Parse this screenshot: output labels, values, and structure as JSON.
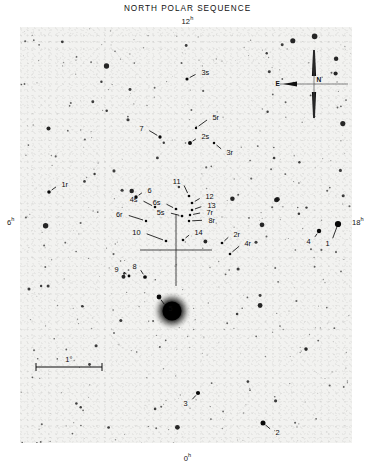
{
  "figure": {
    "title": "NORTH POLAR SEQUENCE",
    "top_axis": "12",
    "top_axis_sup": "h",
    "left_axis": "6",
    "left_axis_sup": "h",
    "right_axis": "18",
    "right_axis_sup": "h",
    "bottom_axis": "0",
    "bottom_axis_sup": "h"
  },
  "compass": {
    "north_label": "N",
    "east_label": "E"
  },
  "scale_bar": {
    "label": "1°"
  },
  "chart_data": {
    "type": "scatter",
    "title": "NORTH POLAR SEQUENCE",
    "xlabel": "Right Ascension (hours)",
    "ylabel": "",
    "grid": false,
    "legend": "none",
    "axis_markers": [
      {
        "position": "top",
        "label": "12h"
      },
      {
        "position": "left",
        "label": "6h"
      },
      {
        "position": "right",
        "label": "18h"
      },
      {
        "position": "bottom",
        "label": "0h"
      }
    ],
    "pole_marker": {
      "x": 176,
      "y": 250,
      "type": "crosshair"
    },
    "scale_bar_degrees": 1,
    "labeled_stars": [
      {
        "label": "3s",
        "lx": 200,
        "ly": 72,
        "sx": 187,
        "sy": 79,
        "mag": 3.0
      },
      {
        "label": "5r",
        "lx": 211,
        "ly": 117,
        "sx": 196,
        "sy": 128,
        "mag": 2.3
      },
      {
        "label": "7",
        "lx": 145,
        "ly": 128,
        "sx": 160,
        "sy": 137,
        "mag": 3.2
      },
      {
        "label": "2s",
        "lx": 200,
        "ly": 136,
        "sx": 190,
        "sy": 143,
        "mag": 3.8
      },
      {
        "label": "3r",
        "lx": 225,
        "ly": 152,
        "sx": 214,
        "sy": 143,
        "mag": 2.4
      },
      {
        "label": "1r",
        "lx": 60,
        "ly": 184,
        "sx": 49,
        "sy": 192,
        "mag": 3.4
      },
      {
        "label": "6",
        "lx": 146,
        "ly": 190,
        "sx": 136,
        "sy": 197,
        "mag": 3.3
      },
      {
        "label": "11",
        "lx": 182,
        "ly": 181,
        "sx": 189,
        "sy": 196,
        "mag": 2.6
      },
      {
        "label": "12",
        "lx": 204,
        "ly": 196,
        "sx": 192,
        "sy": 203,
        "mag": 2.6
      },
      {
        "label": "4s",
        "lx": 139,
        "ly": 199,
        "sx": 155,
        "sy": 207,
        "mag": 2.5
      },
      {
        "label": "6s",
        "lx": 162,
        "ly": 202,
        "sx": 176,
        "sy": 209,
        "mag": 2.6
      },
      {
        "label": "13",
        "lx": 206,
        "ly": 205,
        "sx": 192,
        "sy": 210,
        "mag": 2.5
      },
      {
        "label": "7r",
        "lx": 205,
        "ly": 212,
        "sx": 190,
        "sy": 215,
        "mag": 2.4
      },
      {
        "label": "5s",
        "lx": 166,
        "ly": 212,
        "sx": 182,
        "sy": 216,
        "mag": 2.6
      },
      {
        "label": "6r",
        "lx": 124,
        "ly": 214,
        "sx": 146,
        "sy": 221,
        "mag": 2.4
      },
      {
        "label": "8r",
        "lx": 207,
        "ly": 220,
        "sx": 189,
        "sy": 221,
        "mag": 2.4
      },
      {
        "label": "10",
        "lx": 142,
        "ly": 232,
        "sx": 166,
        "sy": 241,
        "mag": 2.6
      },
      {
        "label": "14",
        "lx": 193,
        "ly": 232,
        "sx": 183,
        "sy": 240,
        "mag": 2.5
      },
      {
        "label": "2r",
        "lx": 232,
        "ly": 234,
        "sx": 222,
        "sy": 243,
        "mag": 2.6
      },
      {
        "label": "4r",
        "lx": 243,
        "ly": 243,
        "sx": 230,
        "sy": 254,
        "mag": 2.5
      },
      {
        "label": "4",
        "lx": 312,
        "ly": 241,
        "sx": 319,
        "sy": 231,
        "mag": 4.2
      },
      {
        "label": "1",
        "lx": 331,
        "ly": 243,
        "sx": 338,
        "sy": 224,
        "mag": 6.0
      },
      {
        "label": "9",
        "lx": 120,
        "ly": 269,
        "sx": 129,
        "sy": 276,
        "mag": 2.7
      },
      {
        "label": "8",
        "lx": 138,
        "ly": 266,
        "sx": 145,
        "sy": 277,
        "mag": 3.6
      },
      {
        "label": "5",
        "lx": 167,
        "ly": 308,
        "sx": 159,
        "sy": 297,
        "mag": 4.6
      },
      {
        "label": "3",
        "lx": 189,
        "ly": 403,
        "sx": 198,
        "sy": 393,
        "mag": 4.0
      },
      {
        "label": "2",
        "lx": 274,
        "ly": 432,
        "sx": 263,
        "sy": 423,
        "mag": 4.8
      }
    ],
    "bright_star": {
      "x": 152,
      "y": 284,
      "name": "Polaris",
      "radius": 13
    },
    "star_count_approx": 620
  }
}
